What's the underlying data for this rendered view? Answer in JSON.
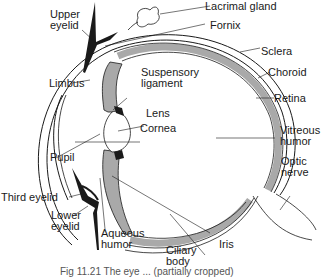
{
  "diagram": {
    "colors": {
      "tissue_fill": "#a9a9a9",
      "line": "#1a1a1a",
      "background": "#ffffff"
    },
    "labels": {
      "upper_eyelid": [
        "Upper",
        "eyelid"
      ],
      "lacrimal_gland": "Lacrimal gland",
      "fornix": "Fornix",
      "sclera": "Sclera",
      "choroid": "Choroid",
      "retina": "Retina",
      "limbus": "Limbus",
      "suspensory_ligament": [
        "Suspensory",
        "ligament"
      ],
      "lens": "Lens",
      "cornea": "Cornea",
      "vitreous_humor": [
        "Vitreous",
        "humor"
      ],
      "pupil": "Pupil",
      "optic_nerve": [
        "Optic",
        "nerve"
      ],
      "third_eyelid": "Third eyelid",
      "lower_eyelid": [
        "Lower",
        "eyelid"
      ],
      "aqueous_humor": [
        "Aqueous",
        "humor"
      ],
      "iris": "Iris",
      "ciliary_body": [
        "Ciliary",
        "body"
      ]
    },
    "caption": "Fig 11.21 The eye ... (partially cropped)"
  }
}
